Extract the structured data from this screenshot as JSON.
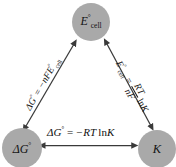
{
  "diagram": {
    "type": "triangle-relationship-diagram",
    "topic": "Thermodynamic and electrochemical relationships",
    "background_color": "#ffffff",
    "node_fill_color": "#a9a9a9",
    "arrow_color": "#3a3a3a",
    "text_color": "#101010",
    "nodes": [
      {
        "id": "ecell",
        "position": "top",
        "symbol": "E",
        "superscript": "°",
        "subscript": "cell",
        "plain_text": "E°cell"
      },
      {
        "id": "delta-g",
        "position": "bottom-left",
        "symbol": "ΔG",
        "superscript": "°",
        "subscript": "",
        "plain_text": "ΔG°"
      },
      {
        "id": "equilibrium-constant",
        "position": "bottom-right",
        "symbol": "K",
        "superscript": "",
        "subscript": "",
        "plain_text": "K"
      }
    ],
    "edges": [
      {
        "id": "edge-bottom",
        "from": "delta-g",
        "to": "equilibrium-constant",
        "arrowheads": "both",
        "orientation": "horizontal",
        "equation_plain": "ΔG° = −RT ln K",
        "parts": {
          "lhs": "ΔG",
          "lhs_sup": "°",
          "operator": "=",
          "rhs_prefix": "−RT",
          "rhs_function": "ln",
          "rhs_argument": "K"
        }
      },
      {
        "id": "edge-left",
        "from": "delta-g",
        "to": "ecell",
        "arrowheads": "both",
        "orientation": "diagonal-up-right",
        "rotation_degrees": -60,
        "equation_plain": "ΔG° = −nFE°cell",
        "parts": {
          "lhs": "ΔG",
          "lhs_sup": "°",
          "operator": "=",
          "rhs_coefficient": "−nF",
          "rhs_symbol": "E",
          "rhs_sup": "°",
          "rhs_sub": "cell"
        }
      },
      {
        "id": "edge-right",
        "from": "ecell",
        "to": "equilibrium-constant",
        "arrowheads": "both",
        "orientation": "diagonal-down-right",
        "rotation_degrees": 61,
        "equation_plain": "E°cell = (RT / nF) ln K",
        "parts": {
          "lhs": "E",
          "lhs_sup": "°",
          "lhs_sub": "cell",
          "operator": "=",
          "fraction_numerator": "RT",
          "fraction_denominator": "nF",
          "rhs_function": "ln",
          "rhs_argument": "K"
        }
      }
    ]
  }
}
